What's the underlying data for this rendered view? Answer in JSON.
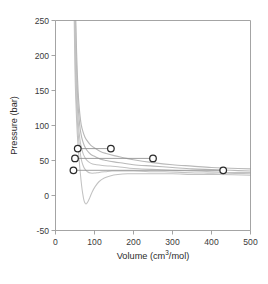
{
  "chart_data": {
    "type": "line",
    "title": "",
    "xlabel": "Volume (cm3/mol)",
    "xlabel_base": "Volume (cm",
    "xlabel_sup": "3",
    "xlabel_tail": "/mol)",
    "ylabel": "Pressure (bar)",
    "xlim": [
      0,
      500
    ],
    "ylim": [
      -50,
      250
    ],
    "xticks": [
      0,
      100,
      200,
      300,
      400,
      500
    ],
    "yticks": [
      -50,
      0,
      50,
      100,
      150,
      200,
      250
    ],
    "xtick_labels": [
      "0",
      "100",
      "200",
      "300",
      "400",
      "500"
    ],
    "ytick_labels": [
      "-50",
      "0",
      "50",
      "100",
      "150",
      "200",
      "250"
    ],
    "grid": false,
    "legend": "none",
    "series": [
      {
        "name": "isotherm-1-hottest",
        "color": "#b9b9b9",
        "points": [
          [
            52,
            250
          ],
          [
            54,
            205
          ],
          [
            56,
            172
          ],
          [
            58,
            148
          ],
          [
            60,
            131
          ],
          [
            63,
            113
          ],
          [
            66,
            101
          ],
          [
            70,
            92
          ],
          [
            75,
            84
          ],
          [
            80,
            79
          ],
          [
            90,
            72
          ],
          [
            100,
            68
          ],
          [
            115,
            63
          ],
          [
            130,
            60
          ],
          [
            150,
            57
          ],
          [
            175,
            54
          ],
          [
            200,
            51
          ],
          [
            250,
            47
          ],
          [
            300,
            44
          ],
          [
            350,
            42
          ],
          [
            400,
            40
          ],
          [
            450,
            39
          ],
          [
            500,
            38
          ]
        ]
      },
      {
        "name": "isotherm-2",
        "color": "#b9b9b9",
        "points": [
          [
            51,
            250
          ],
          [
            53,
            198
          ],
          [
            55,
            163
          ],
          [
            57,
            138
          ],
          [
            59,
            120
          ],
          [
            62,
            101
          ],
          [
            65,
            89
          ],
          [
            69,
            79
          ],
          [
            74,
            71
          ],
          [
            80,
            65
          ],
          [
            90,
            59
          ],
          [
            100,
            56
          ],
          [
            115,
            52
          ],
          [
            130,
            50
          ],
          [
            150,
            48
          ],
          [
            175,
            46
          ],
          [
            200,
            44
          ],
          [
            250,
            42
          ],
          [
            300,
            40
          ],
          [
            350,
            38
          ],
          [
            400,
            37
          ],
          [
            450,
            36
          ],
          [
            500,
            35
          ]
        ]
      },
      {
        "name": "isotherm-3-critical",
        "color": "#c2c2c2",
        "points": [
          [
            50,
            250
          ],
          [
            52,
            190
          ],
          [
            54,
            153
          ],
          [
            56,
            127
          ],
          [
            58,
            108
          ],
          [
            61,
            88
          ],
          [
            64,
            75
          ],
          [
            68,
            65
          ],
          [
            72,
            58
          ],
          [
            78,
            52
          ],
          [
            85,
            48
          ],
          [
            95,
            45
          ],
          [
            105,
            44
          ],
          [
            120,
            43
          ],
          [
            140,
            42
          ],
          [
            160,
            41
          ],
          [
            190,
            39
          ],
          [
            220,
            38
          ],
          [
            260,
            37
          ],
          [
            300,
            36
          ],
          [
            350,
            35
          ],
          [
            400,
            34
          ],
          [
            450,
            33
          ],
          [
            500,
            33
          ]
        ]
      },
      {
        "name": "isotherm-4-subcritical",
        "color": "#c2c2c2",
        "points": [
          [
            49,
            250
          ],
          [
            51,
            184
          ],
          [
            53,
            145
          ],
          [
            55,
            118
          ],
          [
            57,
            98
          ],
          [
            60,
            77
          ],
          [
            63,
            63
          ],
          [
            66,
            52
          ],
          [
            70,
            44
          ],
          [
            75,
            38
          ],
          [
            82,
            34
          ],
          [
            90,
            32
          ],
          [
            100,
            32
          ],
          [
            112,
            33
          ],
          [
            128,
            34
          ],
          [
            145,
            35
          ],
          [
            170,
            35
          ],
          [
            200,
            35
          ],
          [
            240,
            34
          ],
          [
            280,
            34
          ],
          [
            330,
            33
          ],
          [
            380,
            32
          ],
          [
            430,
            32
          ],
          [
            500,
            31
          ]
        ]
      },
      {
        "name": "isotherm-5-coldest-vdw-loop",
        "color": "#c2c2c2",
        "points": [
          [
            48,
            250
          ],
          [
            50,
            178
          ],
          [
            52,
            137
          ],
          [
            54,
            109
          ],
          [
            56,
            87
          ],
          [
            58,
            70
          ],
          [
            61,
            48
          ],
          [
            64,
            30
          ],
          [
            67,
            14
          ],
          [
            70,
            2
          ],
          [
            73,
            -7
          ],
          [
            76,
            -11
          ],
          [
            79,
            -12
          ],
          [
            83,
            -9
          ],
          [
            88,
            -3
          ],
          [
            94,
            5
          ],
          [
            102,
            13
          ],
          [
            112,
            20
          ],
          [
            125,
            25
          ],
          [
            140,
            28
          ],
          [
            160,
            30
          ],
          [
            185,
            31
          ],
          [
            215,
            31
          ],
          [
            250,
            31
          ],
          [
            300,
            31
          ],
          [
            360,
            30
          ],
          [
            420,
            30
          ],
          [
            500,
            29
          ]
        ]
      }
    ],
    "tie_lines": [
      {
        "name": "tie-line-top",
        "pressure": 67,
        "v_liquid": 57,
        "v_vapor": 142
      },
      {
        "name": "tie-line-middle",
        "pressure": 53,
        "v_liquid": 50,
        "v_vapor": 250
      },
      {
        "name": "tie-line-bottom",
        "pressure": 36,
        "v_liquid": 46,
        "v_vapor": 430
      }
    ],
    "markers": [
      {
        "name": "marker-liquid-top",
        "v": 57,
        "p": 67
      },
      {
        "name": "marker-vapor-top",
        "v": 142,
        "p": 67
      },
      {
        "name": "marker-liquid-middle",
        "v": 50,
        "p": 53
      },
      {
        "name": "marker-vapor-middle",
        "v": 250,
        "p": 53
      },
      {
        "name": "marker-liquid-bottom",
        "v": 46,
        "p": 36
      },
      {
        "name": "marker-vapor-bottom",
        "v": 430,
        "p": 36
      }
    ]
  }
}
